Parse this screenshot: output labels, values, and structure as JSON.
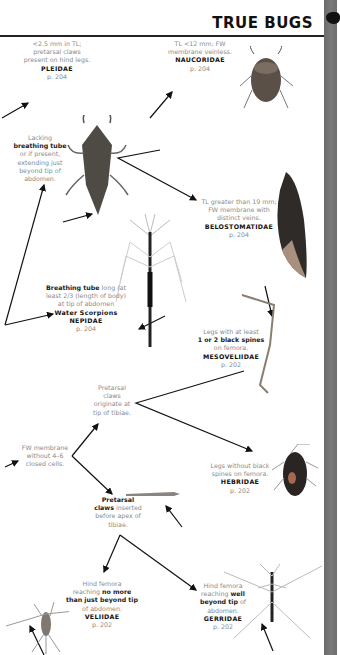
{
  "header": {
    "title": "TRUE BUGS"
  },
  "captions": {
    "pleidae": {
      "l1": "<2.5 mm in TL;",
      "l2": "pretarsal claws",
      "l3": "present on hind legs.",
      "family": "PLEIDAE",
      "page": "p. 204"
    },
    "naucoridae": {
      "l1": "TL <12 mm; FW",
      "l2": "membrane veinless.",
      "family": "NAUCORIDAE",
      "page": "p. 204"
    },
    "lacking_tube": {
      "l1": "Lacking",
      "bold": "breathing tube",
      "l2": "or if present,",
      "l3": "extending just",
      "l4": "beyond tip of",
      "l5": "abdomen."
    },
    "belostomatidae": {
      "l1": "TL greater than 19 mm;",
      "l2": "FW membrane with",
      "l3": "distinct veins.",
      "family": "BELOSTOMATIDAE",
      "page": "p. 204"
    },
    "nepidae": {
      "bold": "Breathing tube",
      "l1": " long (at",
      "l2": "least 2/3 (length of body)",
      "l3": "at tip of abdomen",
      "common": "Water Scorpions",
      "family": "NEPIDAE",
      "page": "p. 204"
    },
    "mesoveliidae": {
      "l1": "Legs with at least",
      "bold": "1 or 2 black spines",
      "l2": "on femora.",
      "family": "MESOVELIIDAE",
      "page": "p. 202"
    },
    "pretarsal_tip": {
      "l1": "Pretarsal",
      "l2": "claws",
      "l3": "originate at",
      "l4": "tip of tibiae."
    },
    "fw_membrane": {
      "l1": "FW membrane",
      "l2": "without 4–6",
      "l3": "closed cells."
    },
    "hebridae": {
      "l1": "Legs without black",
      "l2": "spines on femora.",
      "family": "HEBRIDAE",
      "page": "p. 202"
    },
    "pretarsal_before": {
      "bold1": "Pretarsal",
      "bold2": "claws",
      "l1": " inserted",
      "l2": "before apex of",
      "l3": "tibiae."
    },
    "veliidae": {
      "l1": "Hind femora",
      "l2": "reaching ",
      "bold1": "no more",
      "bold2": "than just beyond tip",
      "l3": "of abdomen.",
      "family": "VELIIDAE",
      "page": "p. 202"
    },
    "gerridae": {
      "l1": "Hind femora",
      "l2": "reaching ",
      "bold1": "well",
      "bold2": "beyond tip",
      "l3": " of",
      "l4": "abdomen.",
      "family": "GERRIDAE",
      "page": "p. 202"
    }
  },
  "colors": {
    "side_strip": "#707070",
    "caption_gray": "#8a8a8a",
    "rule": "#222222"
  }
}
